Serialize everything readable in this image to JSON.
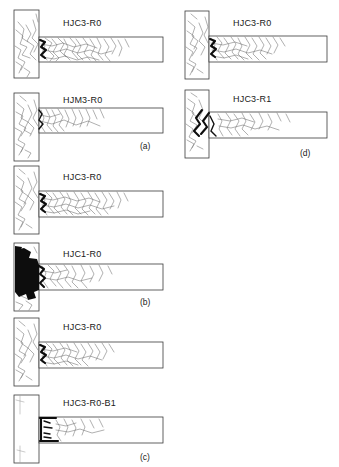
{
  "figure": {
    "kind": "crack-pattern-diagram",
    "columns": 2,
    "panel_count": 4,
    "specimen_count": 8,
    "colors": {
      "background": "#ffffff",
      "outline": "#3a3a3a",
      "crack": "#6e6e6e",
      "spall": "#0d0d0d",
      "text": "#1a1a1a"
    }
  },
  "panels": [
    {
      "sub_label": "(a)",
      "sub_label_x": 140,
      "sub_label_y": 141,
      "column": "left",
      "specimens": [
        {
          "name": "HJC3-R0",
          "label_x": 63,
          "label_y": 18,
          "column_x": 14,
          "column_y": 10,
          "column_w": 25,
          "column_h": 68,
          "beam_x": 39,
          "beam_y": 37,
          "beam_w": 124,
          "beam_h": 25,
          "damage": "distributed-flexural-cracks",
          "spall_level": "light"
        },
        {
          "name": "HJM3-R0",
          "label_x": 63,
          "label_y": 95,
          "column_x": 14,
          "column_y": 93,
          "column_w": 25,
          "column_h": 68,
          "beam_x": 39,
          "beam_y": 108,
          "beam_w": 124,
          "beam_h": 25,
          "damage": "flexural-cracks-column-face",
          "spall_level": "none"
        }
      ]
    },
    {
      "sub_label": "(b)",
      "sub_label_x": 140,
      "sub_label_y": 297,
      "column": "left",
      "specimens": [
        {
          "name": "HJC3-R0",
          "label_x": 63,
          "label_y": 172,
          "column_x": 14,
          "column_y": 166,
          "column_w": 25,
          "column_h": 68,
          "beam_x": 39,
          "beam_y": 191,
          "beam_w": 124,
          "beam_h": 26,
          "damage": "distributed-flexural-cracks",
          "spall_level": "light"
        },
        {
          "name": "HJC1-R0",
          "label_x": 63,
          "label_y": 249,
          "column_x": 14,
          "column_y": 243,
          "column_w": 25,
          "column_h": 68,
          "beam_x": 39,
          "beam_y": 264,
          "beam_w": 124,
          "beam_h": 26,
          "damage": "severe-joint-spalling",
          "spall_level": "severe"
        }
      ]
    },
    {
      "sub_label": "(c)",
      "sub_label_x": 140,
      "sub_label_y": 452,
      "column": "left",
      "specimens": [
        {
          "name": "HJC3-R0",
          "label_x": 63,
          "label_y": 322,
          "column_x": 14,
          "column_y": 318,
          "column_w": 25,
          "column_h": 68,
          "beam_x": 39,
          "beam_y": 342,
          "beam_w": 124,
          "beam_h": 26,
          "damage": "distributed-flexural-cracks",
          "spall_level": "light"
        },
        {
          "name": "HJC3-R0-B1",
          "label_x": 63,
          "label_y": 398,
          "column_x": 14,
          "column_y": 395,
          "column_w": 25,
          "column_h": 68,
          "beam_x": 39,
          "beam_y": 417,
          "beam_w": 124,
          "beam_h": 26,
          "damage": "interface-bond-slip-band",
          "spall_level": "interface"
        }
      ]
    },
    {
      "sub_label": "(d)",
      "sub_label_x": 300,
      "sub_label_y": 148,
      "column": "right",
      "specimens": [
        {
          "name": "HJC3-R0",
          "label_x": 233,
          "label_y": 18,
          "column_x": 185,
          "column_y": 11,
          "column_w": 24,
          "column_h": 68,
          "beam_x": 209,
          "beam_y": 36,
          "beam_w": 118,
          "beam_h": 26,
          "damage": "distributed-flexural-cracks",
          "spall_level": "light"
        },
        {
          "name": "HJC3-R1",
          "label_x": 233,
          "label_y": 94,
          "column_x": 185,
          "column_y": 90,
          "column_w": 24,
          "column_h": 68,
          "beam_x": 209,
          "beam_y": 112,
          "beam_w": 118,
          "beam_h": 26,
          "damage": "diagonal-shear-band",
          "spall_level": "moderate"
        }
      ]
    }
  ]
}
